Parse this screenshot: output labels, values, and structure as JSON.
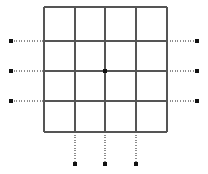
{
  "figure": {
    "name": "square-mesh-with-boundary-markers",
    "width": 208,
    "height": 174,
    "background_color": "#ffffff"
  },
  "style": {
    "mesh_line_color": "#555555",
    "mesh_line_width": 1.6,
    "dotted_line_color": "#8c8c8c",
    "dotted_line_width": 1.3,
    "dot_dash_pattern": "1,1.6",
    "marker_color": "#111111",
    "marker_size": 4.2,
    "center_node_color": "#111111",
    "center_node_size": 4.2
  },
  "mesh": {
    "type": "structured-quad-grid",
    "divisions_x": 4,
    "divisions_y": 4,
    "bounds": {
      "left": 44,
      "top": 7,
      "right": 167,
      "bottom": 132
    },
    "vertical_line_x": [
      44,
      75,
      105,
      136,
      167
    ],
    "horizontal_line_y": [
      7,
      41,
      71,
      101,
      132
    ],
    "cell_count": 16
  },
  "center_node": {
    "x": 105,
    "y": 71
  },
  "boundary_markers": {
    "left": [
      {
        "label": "left-marker-1",
        "x": 11,
        "y": 41,
        "attach_x": 44
      },
      {
        "label": "left-marker-2",
        "x": 11,
        "y": 71,
        "attach_x": 44
      },
      {
        "label": "left-marker-3",
        "x": 11,
        "y": 101,
        "attach_x": 44
      }
    ],
    "right": [
      {
        "label": "right-marker-1",
        "x": 197,
        "y": 41,
        "attach_x": 167
      },
      {
        "label": "right-marker-2",
        "x": 197,
        "y": 71,
        "attach_x": 167
      },
      {
        "label": "right-marker-3",
        "x": 197,
        "y": 101,
        "attach_x": 167
      }
    ],
    "bottom": [
      {
        "label": "bottom-marker-1",
        "x": 75,
        "y": 164,
        "attach_y": 132
      },
      {
        "label": "bottom-marker-2",
        "x": 105,
        "y": 164,
        "attach_y": 132
      },
      {
        "label": "bottom-marker-3",
        "x": 136,
        "y": 164,
        "attach_y": 132
      }
    ]
  },
  "labels": {
    "title": "",
    "caption": ""
  }
}
